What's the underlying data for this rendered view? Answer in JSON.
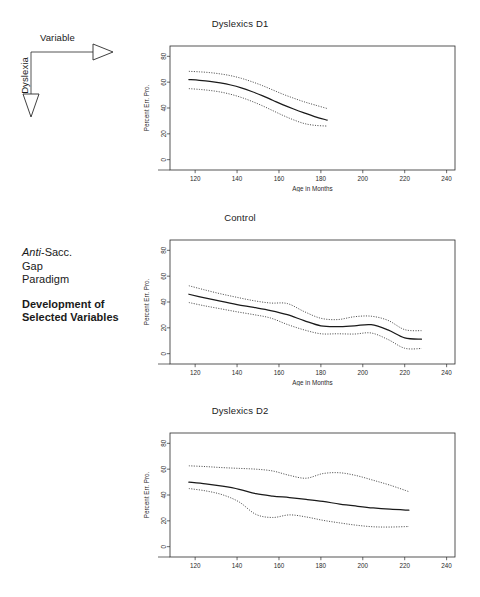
{
  "figure": {
    "axis_diagram": {
      "horizontal_label": "Variable",
      "vertical_label": "Dyslexia"
    },
    "caption": {
      "line1_italic": "Anti",
      "line1_rest": "-Sacc.",
      "line2": "Gap",
      "line3": "Paradigm",
      "headline1": "Development of",
      "headline2": "Selected Variables"
    }
  },
  "chart_data": [
    {
      "type": "line",
      "title": "Dyslexics D1",
      "xlabel": "Age in Months",
      "ylabel": "Percent Err. Pro.",
      "xlim": [
        108,
        244
      ],
      "ylim": [
        -8,
        88
      ],
      "xticks": [
        120,
        140,
        160,
        180,
        200,
        220,
        240
      ],
      "yticks": [
        0,
        20,
        40,
        60,
        80
      ],
      "grid": false,
      "legend": "none",
      "series": [
        {
          "name": "fit",
          "style": "solid",
          "x": [
            117,
            122,
            127,
            132,
            137,
            142,
            147,
            152,
            157,
            162,
            167,
            172,
            177,
            183
          ],
          "values": [
            62.0,
            61.4,
            60.6,
            59.4,
            57.8,
            55.6,
            52.8,
            49.6,
            46.0,
            42.4,
            39.2,
            36.2,
            33.4,
            30.6
          ]
        },
        {
          "name": "upper-ci",
          "style": "dotted",
          "x": [
            117,
            122,
            127,
            132,
            137,
            142,
            147,
            152,
            157,
            162,
            167,
            172,
            177,
            183
          ],
          "values": [
            68.4,
            68.0,
            67.4,
            66.4,
            65.0,
            63.0,
            60.4,
            57.4,
            54.0,
            50.6,
            47.6,
            44.8,
            42.4,
            39.6
          ]
        },
        {
          "name": "lower-ci",
          "style": "dotted",
          "x": [
            117,
            122,
            127,
            132,
            137,
            142,
            147,
            152,
            157,
            162,
            167,
            172,
            177,
            183
          ],
          "values": [
            55.0,
            54.4,
            53.6,
            52.4,
            50.6,
            48.2,
            45.2,
            41.8,
            38.0,
            34.2,
            30.8,
            28.0,
            26.6,
            26.0
          ]
        }
      ]
    },
    {
      "type": "line",
      "title": "Control",
      "xlabel": "Age in Months",
      "ylabel": "Percent Err. Pro.",
      "xlim": [
        108,
        244
      ],
      "ylim": [
        -8,
        88
      ],
      "xticks": [
        120,
        140,
        160,
        180,
        200,
        220,
        240
      ],
      "yticks": [
        0,
        20,
        40,
        60,
        80
      ],
      "grid": false,
      "legend": "none",
      "series": [
        {
          "name": "fit",
          "style": "solid",
          "x": [
            117,
            124,
            132,
            140,
            148,
            156,
            164,
            172,
            180,
            188,
            196,
            204,
            212,
            220,
            228
          ],
          "values": [
            46.0,
            43.4,
            40.6,
            38.0,
            35.8,
            33.4,
            30.2,
            25.6,
            21.6,
            21.0,
            21.6,
            22.4,
            18.4,
            12.2,
            11.2
          ]
        },
        {
          "name": "upper-ci",
          "style": "dotted",
          "x": [
            117,
            124,
            132,
            140,
            148,
            156,
            164,
            172,
            180,
            188,
            196,
            204,
            212,
            220,
            228
          ],
          "values": [
            52.6,
            49.6,
            46.4,
            43.6,
            41.0,
            39.2,
            38.8,
            32.6,
            27.4,
            26.4,
            28.6,
            29.0,
            25.8,
            18.6,
            17.8
          ]
        },
        {
          "name": "lower-ci",
          "style": "dotted",
          "x": [
            117,
            124,
            132,
            140,
            148,
            156,
            164,
            172,
            180,
            188,
            196,
            204,
            212,
            220,
            228
          ],
          "values": [
            39.6,
            37.2,
            34.8,
            32.4,
            30.2,
            27.6,
            22.6,
            18.4,
            15.4,
            15.4,
            15.2,
            16.0,
            11.0,
            4.2,
            4.0
          ]
        }
      ]
    },
    {
      "type": "line",
      "title": "Dyslexics D2",
      "xlabel": "",
      "ylabel": "Percent Err. Pro.",
      "xlim": [
        108,
        244
      ],
      "ylim": [
        -8,
        88
      ],
      "xticks": [
        120,
        140,
        160,
        180,
        200,
        220,
        240
      ],
      "yticks": [
        0,
        20,
        40,
        60,
        80
      ],
      "grid": false,
      "legend": "none",
      "series": [
        {
          "name": "fit",
          "style": "solid",
          "x": [
            117,
            125,
            133,
            141,
            149,
            157,
            165,
            173,
            181,
            189,
            197,
            205,
            213,
            222
          ],
          "values": [
            50.0,
            48.6,
            46.8,
            44.4,
            41.0,
            39.2,
            38.0,
            36.6,
            35.0,
            33.0,
            31.4,
            30.0,
            29.0,
            28.2
          ]
        },
        {
          "name": "upper-ci",
          "style": "dotted",
          "x": [
            117,
            125,
            133,
            141,
            149,
            157,
            165,
            173,
            181,
            189,
            197,
            205,
            213,
            222
          ],
          "values": [
            62.6,
            62.0,
            61.2,
            60.6,
            60.0,
            58.6,
            55.2,
            53.0,
            56.6,
            57.2,
            55.0,
            51.4,
            47.6,
            42.6
          ]
        },
        {
          "name": "lower-ci",
          "style": "dotted",
          "x": [
            117,
            125,
            133,
            141,
            149,
            157,
            165,
            173,
            181,
            189,
            197,
            205,
            213,
            222
          ],
          "values": [
            45.0,
            43.2,
            40.2,
            34.6,
            25.0,
            22.6,
            24.6,
            23.0,
            20.4,
            18.4,
            16.6,
            15.4,
            15.2,
            15.6
          ]
        }
      ]
    }
  ]
}
